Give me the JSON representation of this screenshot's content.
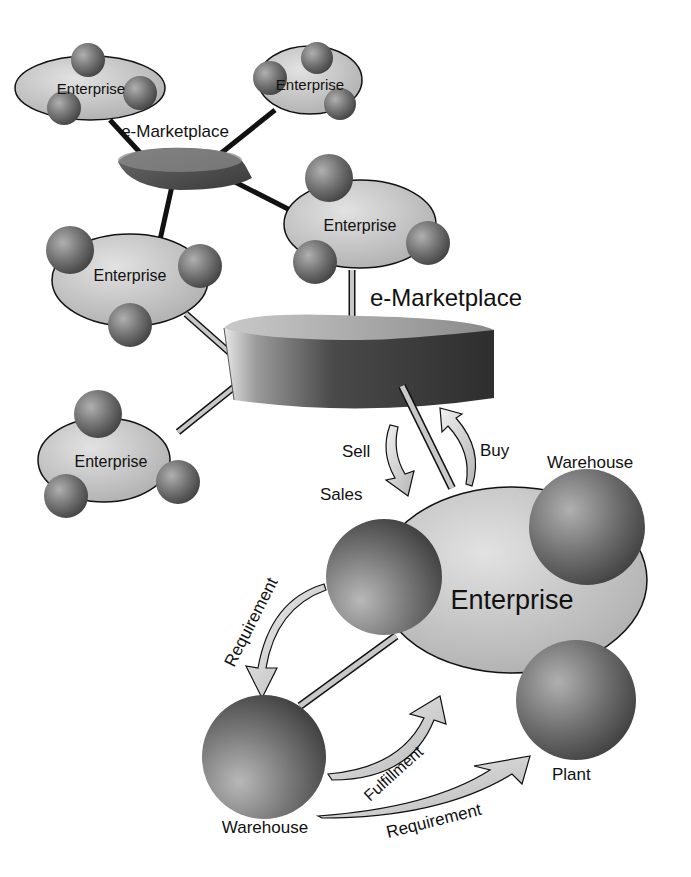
{
  "diagram": {
    "type": "network",
    "colors": {
      "background": "#ffffff",
      "cloud_fill": "#c4c4c4",
      "sphere_dark": "#444444",
      "sphere_light": "#a8a8a8",
      "marketplace_dark": "#3a3a3a",
      "connector_dark": "#111111",
      "connector_light": "#c8c8c8",
      "arrow_fill": "#d8d8d8",
      "text": "#111111"
    },
    "nodes": {
      "small_marketplace": {
        "label": "e-Marketplace"
      },
      "large_marketplace": {
        "label": "e-Marketplace"
      },
      "enterprise_top_left": {
        "label": "Enterprise"
      },
      "enterprise_top_right": {
        "label": "Enterprise"
      },
      "enterprise_mid_left": {
        "label": "Enterprise"
      },
      "enterprise_mid_right": {
        "label": "Enterprise"
      },
      "enterprise_bottom_left": {
        "label": "Enterprise"
      },
      "enterprise_main": {
        "label": "Enterprise"
      },
      "sales": {
        "label": "Sales"
      },
      "warehouse_top": {
        "label": "Warehouse"
      },
      "warehouse_bottom": {
        "label": "Warehouse"
      },
      "plant": {
        "label": "Plant"
      }
    },
    "flows": {
      "sell": {
        "label": "Sell"
      },
      "buy": {
        "label": "Buy"
      },
      "requirement_left": {
        "label": "Requirement"
      },
      "fulfillment": {
        "label": "Fulfillment"
      },
      "requirement_bottom": {
        "label": "Requirement"
      }
    }
  }
}
